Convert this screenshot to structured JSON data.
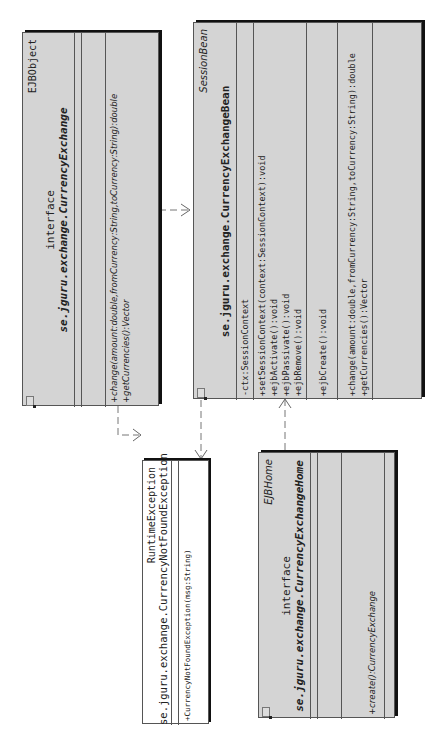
{
  "diagram": {
    "type": "uml-class",
    "orientation": "rotated-90-ccw",
    "classes": [
      {
        "id": "ejbobject",
        "stereotype": "EJBObject",
        "kind": "interface",
        "name": "se.jguru.exchange.CurrencyExchange",
        "attributes": [],
        "methods": [
          "+change(amount:double,fromCurrency:String,toCurrency:String):double",
          "+getCurrencies():Vector"
        ]
      },
      {
        "id": "sessionbean",
        "stereotype": "SessionBean",
        "kind": "",
        "name": "se.jguru.exchange.CurrencyExchangeBean",
        "attributes": [
          "-ctx:SessionContext"
        ],
        "methods_lifecycle": [
          "+setSessionContext(context:SessionContext):void",
          "+ejbActivate():void",
          "+ejbPassivate():void",
          "+ejbRemove():void"
        ],
        "methods_create": [
          "+ejbCreate():void"
        ],
        "methods_business": [
          "+change(amount:double,fromCurrency:String,toCurrency:String):double",
          "+getCurrencies():Vector"
        ]
      },
      {
        "id": "exception",
        "stereotype": "RuntimeException",
        "name": "se.jguru.exchange.CurrencyNotFoundException",
        "methods": [
          "+CurrencyNotFoundException(msg:String)"
        ]
      },
      {
        "id": "ejbhome",
        "stereotype": "EJBHome",
        "kind": "interface",
        "name": "se.jguru.exchange.CurrencyExchangeHome",
        "methods": [
          "+create():CurrencyExchange"
        ]
      }
    ],
    "relations": [
      {
        "from": "ejbobject",
        "to": "sessionbean",
        "style": "dashed",
        "arrow": "open"
      },
      {
        "from": "ejbobject",
        "to": "exception",
        "style": "dashed",
        "arrow": "open"
      },
      {
        "from": "sessionbean",
        "to": "exception",
        "style": "dashed",
        "arrow": "open"
      },
      {
        "from": "ejbhome",
        "to": "sessionbean",
        "style": "dashed",
        "arrow": "open"
      }
    ]
  }
}
